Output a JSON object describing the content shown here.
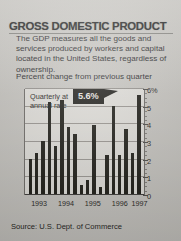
{
  "headline": "GROSS DOMESTIC PRODUCT",
  "description": "The GDP measures all the goods and services produced by workers and capital located in the United States, regardless of ownership.",
  "subnote": "Percent change from previous quarter",
  "source": "Source: U.S. Dept. of Commerce",
  "inline_note": "Quarterly at\nannual rate",
  "inline_note_line1": "Quarterly at",
  "inline_note_line2": "annual rate",
  "callout": {
    "label": "5.6%",
    "background": "#171612",
    "text_color": "#f2f0ea"
  },
  "colors": {
    "page_background": "#cbc9c4",
    "plot_background": "#e6e4df",
    "bar": "#16150f",
    "gridline": "#8d8a85",
    "text": "#1d1c19"
  },
  "chart_data": {
    "type": "bar",
    "title": "GROSS DOMESTIC PRODUCT",
    "subtitle": "Percent change from previous quarter",
    "xlabel": "",
    "ylabel": "",
    "ylim": [
      0,
      6
    ],
    "yticks": [
      0,
      1,
      2,
      3,
      4,
      5,
      6
    ],
    "ytick_labels": [
      "0",
      "1",
      "2",
      "3",
      "4",
      "5",
      "6%"
    ],
    "grid": true,
    "legend": false,
    "categories": [
      "1993 Q1",
      "1993 Q2",
      "1993 Q3",
      "1993 Q4",
      "1994 Q1",
      "1994 Q2",
      "1994 Q3",
      "1994 Q4",
      "1995 Q1",
      "1995 Q2",
      "1995 Q3",
      "1995 Q4",
      "1996 Q1",
      "1996 Q2",
      "1996 Q3",
      "1996 Q4",
      "1997 Q1",
      "1997 Q2"
    ],
    "values": [
      2.0,
      2.3,
      3.0,
      5.2,
      2.7,
      5.3,
      3.8,
      3.4,
      0.5,
      0.8,
      3.9,
      0.4,
      2.2,
      5.0,
      2.2,
      3.7,
      2.3,
      5.6
    ],
    "xtick_labels": [
      "1993",
      "1994",
      "1995",
      "1996",
      "1997"
    ],
    "xtick_positions": [
      12.5,
      34.7,
      56.9,
      79.2,
      95.5
    ],
    "annotations": [
      {
        "text": "5.6%",
        "points_to": "1997 Q2",
        "value": 5.6
      },
      {
        "text": "Quarterly at annual rate",
        "kind": "inline-label"
      }
    ]
  }
}
